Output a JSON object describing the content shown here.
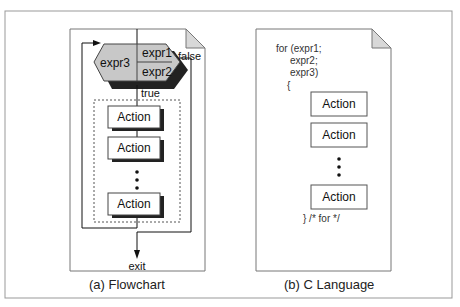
{
  "flowchart": {
    "caption": "(a) Flowchart",
    "init": "expr1",
    "test": "expr2",
    "update": "expr3",
    "true_label": "true",
    "false_label": "false",
    "exit_label": "exit",
    "actions": [
      "Action",
      "Action",
      "Action"
    ]
  },
  "c_language": {
    "caption": "(b) C Language",
    "code_lines": [
      "for (expr1;",
      "     expr2;",
      "     expr3)",
      "    {"
    ],
    "closing": "} /* for */",
    "actions": [
      "Action",
      "Action",
      "Action"
    ]
  },
  "colors": {
    "hexagon_fill": "#c8c8c8",
    "shadow": "#222222",
    "frame": "#888888",
    "page_fold": "#d8d8d8"
  }
}
